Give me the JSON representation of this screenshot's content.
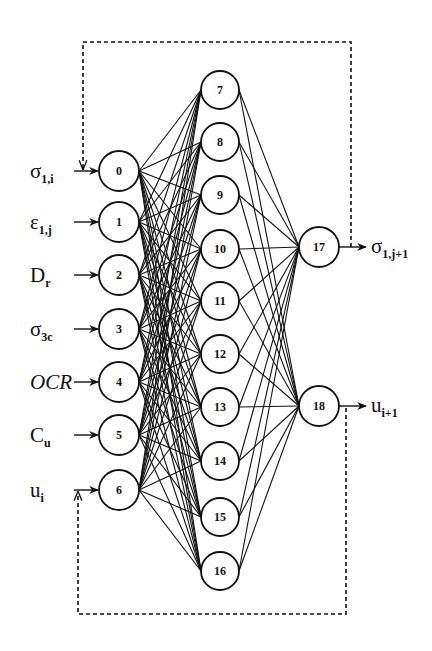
{
  "network": {
    "input_layer": [
      {
        "id": "0",
        "label": "σ",
        "sub": "1,i",
        "x": 119,
        "y": 171
      },
      {
        "id": "1",
        "label": "ε",
        "sub": "1,j",
        "x": 119,
        "y": 222
      },
      {
        "id": "2",
        "label": "D",
        "sub": "r",
        "x": 119,
        "y": 275
      },
      {
        "id": "3",
        "label": "σ",
        "sub": "3c",
        "x": 119,
        "y": 329
      },
      {
        "id": "4",
        "label": "OCR",
        "sub": "",
        "x": 119,
        "y": 382,
        "italic": true
      },
      {
        "id": "5",
        "label": "C",
        "sub": "u",
        "x": 119,
        "y": 435
      },
      {
        "id": "6",
        "label": "u",
        "sub": "i",
        "x": 119,
        "y": 490
      }
    ],
    "hidden_layer": [
      {
        "id": "7",
        "x": 220,
        "y": 90
      },
      {
        "id": "8",
        "x": 220,
        "y": 142
      },
      {
        "id": "9",
        "x": 220,
        "y": 195
      },
      {
        "id": "10",
        "x": 220,
        "y": 249
      },
      {
        "id": "11",
        "x": 220,
        "y": 301
      },
      {
        "id": "12",
        "x": 220,
        "y": 354
      },
      {
        "id": "13",
        "x": 220,
        "y": 407
      },
      {
        "id": "14",
        "x": 220,
        "y": 461
      },
      {
        "id": "15",
        "x": 220,
        "y": 517
      },
      {
        "id": "16",
        "x": 220,
        "y": 571
      }
    ],
    "output_layer": [
      {
        "id": "17",
        "label": "σ",
        "sub": "1,j+1",
        "x": 319,
        "y": 247
      },
      {
        "id": "18",
        "label": "u",
        "sub": "i+1",
        "x": 319,
        "y": 406
      }
    ],
    "feedback_loops": [
      {
        "from": "17",
        "to": "0",
        "style": "dashed",
        "path_y": 42
      },
      {
        "from": "18",
        "to": "6",
        "style": "dashed",
        "path_y": 614
      }
    ],
    "connectivity": "fully connected between adjacent layers",
    "radius": {
      "input": 20,
      "hidden": 19,
      "output": 20
    }
  }
}
